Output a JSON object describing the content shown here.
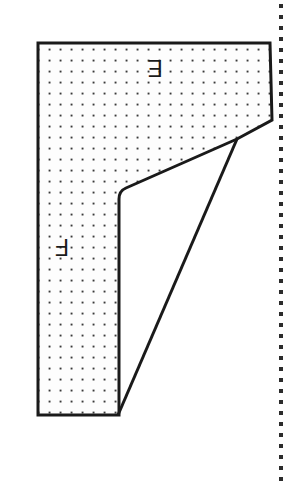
{
  "figure": {
    "background_color": "#ffffff",
    "outline_color": "#1a1a1a",
    "fill_pattern": "dotted",
    "dot_color": "#3a3a3a",
    "fill_background_color": "#fdfdfd",
    "dot_spacing_px": 11,
    "outline_width_px": 3,
    "labels": [
      {
        "id": "label-e",
        "text": "E",
        "rotation_deg": 180,
        "x": 155,
        "y": 68,
        "region": "upper-flange"
      },
      {
        "id": "label-f",
        "text": "F",
        "rotation_deg": 180,
        "x": 62,
        "y": 247,
        "region": "lower-web"
      }
    ],
    "polygon_vertices": [
      [
        38,
        43
      ],
      [
        270,
        43
      ],
      [
        272,
        120
      ],
      [
        237,
        139
      ],
      [
        124,
        189
      ],
      [
        119,
        197
      ],
      [
        119,
        415
      ],
      [
        38,
        415
      ]
    ],
    "diagonal_line": {
      "id": "triangle-hypotenuse",
      "from": [
        237,
        139
      ],
      "to": [
        118,
        415
      ]
    },
    "perforation_line": {
      "id": "page-edge-perforation",
      "x": 281,
      "dot_spacing_px": 11,
      "dot_radius_px": 2,
      "color": "#2b2b2b",
      "y_start": 6,
      "y_end": 480
    }
  }
}
